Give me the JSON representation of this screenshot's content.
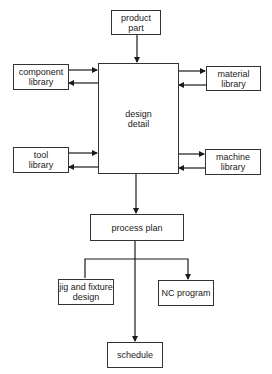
{
  "diagram": {
    "type": "flowchart",
    "nodes": {
      "product_part": {
        "label": "product\npart"
      },
      "design_detail": {
        "label": "design\ndetail"
      },
      "component_library": {
        "label": "component\nlibrary"
      },
      "material_library": {
        "label": "material\nlibrary"
      },
      "tool_library": {
        "label": "tool\nlibrary"
      },
      "machine_library": {
        "label": "machine\nlibrary"
      },
      "process_plan": {
        "label": "process plan"
      },
      "jig_fixture": {
        "label": "jig and fixture\ndesign"
      },
      "nc_program": {
        "label": "NC program"
      },
      "schedule": {
        "label": "schedule"
      }
    },
    "edges": [
      {
        "from": "product part",
        "to": "design detail"
      },
      {
        "from": "component library",
        "to": "design detail"
      },
      {
        "from": "design detail",
        "to": "component library"
      },
      {
        "from": "design detail",
        "to": "material library"
      },
      {
        "from": "material library",
        "to": "design detail"
      },
      {
        "from": "tool library",
        "to": "design detail"
      },
      {
        "from": "design detail",
        "to": "tool library"
      },
      {
        "from": "design detail",
        "to": "machine library"
      },
      {
        "from": "machine library",
        "to": "design detail"
      },
      {
        "from": "design detail",
        "to": "process plan"
      },
      {
        "from": "process plan",
        "to": "jig and fixture design"
      },
      {
        "from": "process plan",
        "to": "NC program"
      },
      {
        "from": "process plan",
        "to": "schedule"
      }
    ]
  }
}
